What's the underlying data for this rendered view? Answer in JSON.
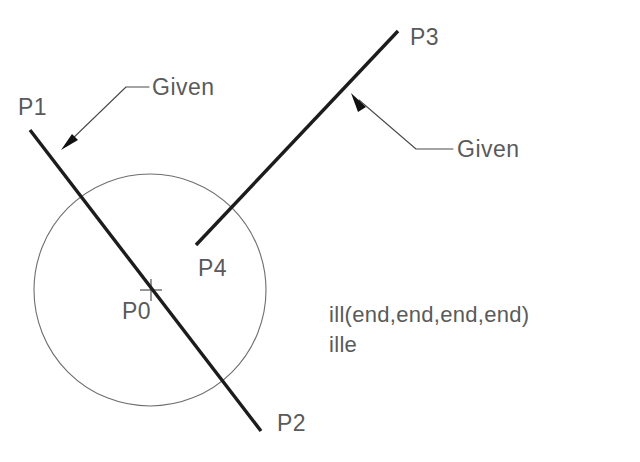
{
  "diagram": {
    "background_color": "#ffffff",
    "line_color": "#1c1c1c",
    "circle_color": "#6e6e6e",
    "text_color": "#5a5a5a",
    "leader_color": "#4a4a4a",
    "canvas": {
      "width": 640,
      "height": 462
    },
    "labels": {
      "p0": "P0",
      "p1": "P1",
      "p2": "P2",
      "p3": "P3",
      "p4": "P4",
      "given_left": "Given",
      "given_right": "Given"
    },
    "command_text": {
      "line1": "ill(end,end,end,end)",
      "line2": "ille"
    },
    "geometry": {
      "circle": {
        "cx": 150,
        "cy": 290,
        "r": 116
      },
      "center_mark": {
        "x": 151,
        "y": 290,
        "size": 11
      },
      "line_p1_p2": {
        "x1": 30,
        "y1": 130,
        "x2": 261,
        "y2": 431
      },
      "line_p3_p4": {
        "x1": 398,
        "y1": 31,
        "x2": 196,
        "y2": 245
      },
      "leader_left": {
        "tip_x": 62,
        "tip_y": 149,
        "elbow_x": 126,
        "elbow_y": 87,
        "end_x": 149,
        "end_y": 87
      },
      "leader_right": {
        "tip_x": 352,
        "tip_y": 94,
        "elbow_x": 416,
        "elbow_y": 149,
        "end_x": 453,
        "end_y": 149
      }
    },
    "label_positions": {
      "p0": {
        "x": 122,
        "y": 319
      },
      "p1": {
        "x": 18,
        "y": 115
      },
      "p2": {
        "x": 277,
        "y": 431
      },
      "p3": {
        "x": 410,
        "y": 45
      },
      "p4": {
        "x": 198,
        "y": 276
      },
      "given_left": {
        "x": 152,
        "y": 95
      },
      "given_right": {
        "x": 457,
        "y": 157
      },
      "code_line1": {
        "x": 329,
        "y": 322
      },
      "code_line2": {
        "x": 329,
        "y": 352
      }
    }
  }
}
